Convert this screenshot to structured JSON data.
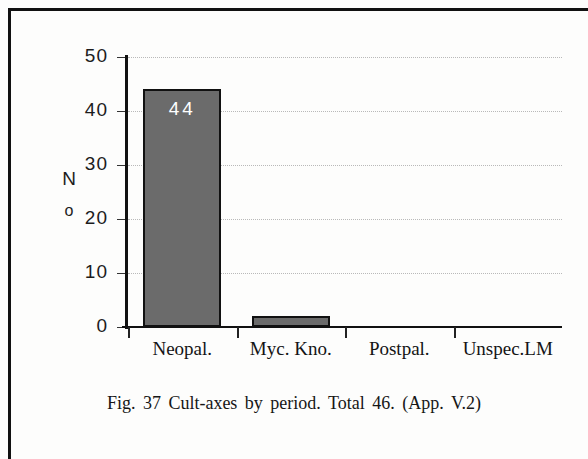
{
  "figure": {
    "caption": "Fig. 37  Cult-axes  by  period.  Total  46.  (App. V.2)"
  },
  "axis_title": {
    "line1": "N",
    "line2": "o"
  },
  "chart_data": {
    "type": "bar",
    "title": "",
    "subtitle": "",
    "xlabel": "",
    "ylabel": "No",
    "categories": [
      "Neopal.",
      "Myc. Kno.",
      "Postpal.",
      "Unspec.LM"
    ],
    "values": [
      44,
      2,
      0,
      0
    ],
    "data_labels": [
      "44",
      "",
      "",
      ""
    ],
    "ylim": [
      0,
      50
    ],
    "yticks": [
      0,
      10,
      20,
      30,
      40,
      50
    ],
    "ytick_labels": [
      "0",
      "10",
      "20",
      "30",
      "40",
      "50"
    ],
    "grid": true,
    "grid_style": "dotted-horizontal",
    "legend": false,
    "bar_color": "#6b6b6b",
    "bar_edge_color": "#111111",
    "value_label_color": "#ffffff",
    "total": 46
  }
}
